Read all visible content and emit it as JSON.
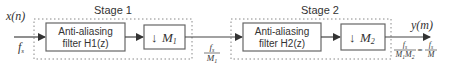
{
  "diagram": {
    "input": {
      "signal": "x(n)",
      "rate_main": "f",
      "rate_sub": "s"
    },
    "output": {
      "signal": "y(m)"
    },
    "stages": [
      {
        "label": "Stage 1",
        "filter": {
          "line1": "Anti-aliasing",
          "line2": "filter H1(z)"
        },
        "decimator": {
          "arrow": "↓",
          "symbol": "M",
          "sub": "1"
        },
        "output_rate": {
          "num_main": "f",
          "num_sub": "s",
          "den_main": "M",
          "den_sub": "1"
        }
      },
      {
        "label": "Stage 2",
        "filter": {
          "line1": "Anti-aliasing",
          "line2": "filter H2(z)"
        },
        "decimator": {
          "arrow": "↓",
          "symbol": "M",
          "sub": "2"
        },
        "output_rate": {
          "num_main": "f",
          "num_sub": "s",
          "den_m1": "M",
          "den_m1_sub": "1",
          "den_m2": "M",
          "den_m2_sub": "2",
          "equals": "=",
          "rhs_num_main": "f",
          "rhs_num_sub": "s",
          "rhs_den": "M"
        }
      }
    ],
    "colors": {
      "line": "#444444",
      "box_border": "#666666",
      "dotted": "#888888",
      "text": "#333333"
    }
  }
}
